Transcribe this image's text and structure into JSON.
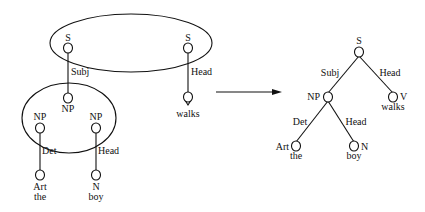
{
  "diagram": {
    "type": "feature-structure unification / tree combination",
    "left": {
      "top_group": {
        "s1": {
          "category": "S",
          "edge_label": "Subj"
        },
        "s2": {
          "category": "S",
          "edge_label": "Head"
        }
      },
      "np_group": {
        "np_top": {
          "category": "NP"
        },
        "np_left": {
          "category": "NP",
          "edge_label": "Det"
        },
        "np_right": {
          "category": "NP",
          "edge_label": "Head"
        }
      },
      "leaves": {
        "verb": {
          "category": "V",
          "word": "walks"
        },
        "art": {
          "category": "Art",
          "word": "the"
        },
        "noun": {
          "category": "N",
          "word": "boy"
        }
      }
    },
    "arrow": {
      "direction": "right"
    },
    "right": {
      "root": {
        "category": "S"
      },
      "subj_edge": {
        "label": "Subj"
      },
      "head_edge": {
        "label": "Head"
      },
      "np": {
        "category": "NP"
      },
      "v": {
        "category": "V",
        "word": "walks"
      },
      "det_edge": {
        "label": "Det"
      },
      "np_head_edge": {
        "label": "Head"
      },
      "art": {
        "category": "Art",
        "word": "the"
      },
      "n": {
        "category": "N",
        "word": "boy"
      }
    }
  }
}
